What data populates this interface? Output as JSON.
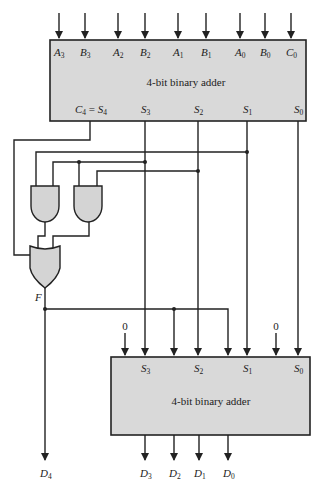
{
  "colors": {
    "box_fill": "#d9d9d9",
    "line": "#222222",
    "background": "#ffffff"
  },
  "top_adder": {
    "title": "4-bit binary adder",
    "inputs": [
      {
        "main": "A",
        "sub": "3"
      },
      {
        "main": "B",
        "sub": "3"
      },
      {
        "main": "A",
        "sub": "2"
      },
      {
        "main": "B",
        "sub": "2"
      },
      {
        "main": "A",
        "sub": "1"
      },
      {
        "main": "B",
        "sub": "1"
      },
      {
        "main": "A",
        "sub": "0"
      },
      {
        "main": "B",
        "sub": "0"
      },
      {
        "main": "C",
        "sub": "0"
      }
    ],
    "outputs": [
      {
        "main": "C",
        "sub": "4",
        "eq": " = ",
        "main2": "S",
        "sub2": "4"
      },
      {
        "main": "S",
        "sub": "3"
      },
      {
        "main": "S",
        "sub": "2"
      },
      {
        "main": "S",
        "sub": "1"
      },
      {
        "main": "S",
        "sub": "0"
      }
    ]
  },
  "logic": {
    "or_output_label": "F"
  },
  "bottom_adder": {
    "title": "4-bit binary adder",
    "constant_inputs": [
      "0",
      "0"
    ],
    "inputs": [
      {
        "main": "S",
        "sub": "3"
      },
      {
        "main": "S",
        "sub": "2"
      },
      {
        "main": "S",
        "sub": "1"
      },
      {
        "main": "S",
        "sub": "0"
      }
    ],
    "outputs": [
      {
        "main": "D",
        "sub": "3"
      },
      {
        "main": "D",
        "sub": "2"
      },
      {
        "main": "D",
        "sub": "1"
      },
      {
        "main": "D",
        "sub": "0"
      }
    ]
  },
  "final_carry": {
    "main": "D",
    "sub": "4"
  }
}
